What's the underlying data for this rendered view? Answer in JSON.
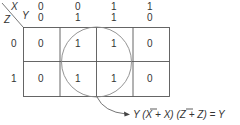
{
  "kmap": {
    "corner": {
      "x_label": "X",
      "y_label": "Y",
      "z_label": "Z"
    },
    "column_headers": [
      {
        "x": "0",
        "y": "0"
      },
      {
        "x": "0",
        "y": "1"
      },
      {
        "x": "1",
        "y": "1"
      },
      {
        "x": "1",
        "y": "0"
      }
    ],
    "row_headers": [
      "0",
      "1"
    ],
    "cells": [
      [
        "0",
        "1",
        "1",
        "0"
      ],
      [
        "0",
        "1",
        "1",
        "0"
      ]
    ],
    "grouping": {
      "shape": "circle",
      "covers": "Y = 1 columns"
    },
    "equation": {
      "parts": [
        "Y (",
        "X",
        " + X) (",
        "Z",
        " + Z) = Y"
      ],
      "overbar_parts": [
        1,
        3
      ],
      "full_text": "Y (X̄ + X) (Z̄ + Z) = Y"
    }
  },
  "colors": {
    "line": "#555555",
    "text": "#333333",
    "circle": "#888888"
  }
}
